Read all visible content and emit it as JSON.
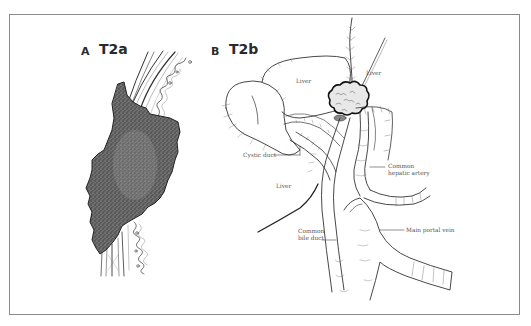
{
  "figure": {
    "panels": [
      {
        "letter": "A",
        "title": "T2a"
      },
      {
        "letter": "B",
        "title": "T2b"
      }
    ],
    "labels": {
      "liver_top_left": "Liver",
      "liver_top_right": "Liver",
      "cystic_duct": "Cystic duct",
      "common_hepatic_artery_line1": "Common",
      "common_hepatic_artery_line2": "hepatic artery",
      "liver_lower": "Liver",
      "common_bile_duct_line1": "Common",
      "common_bile_duct_line2": "bile duct",
      "main_portal_vein": "Main portal vein"
    },
    "colors": {
      "frame_border": "#8a8a8a",
      "line_art": "#333333",
      "tumor_fill": "#4a4a4a",
      "label_text": "#555555"
    }
  }
}
